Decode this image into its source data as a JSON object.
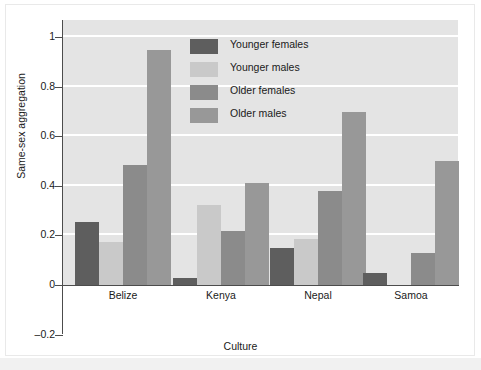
{
  "chart_data": {
    "type": "bar",
    "title": "",
    "xlabel": "Culture",
    "ylabel": "Same-sex aggregation",
    "categories": [
      "Belize",
      "Kenya",
      "Nepal",
      "Samoa"
    ],
    "series": [
      {
        "name": "Younger females",
        "color": "#5e5e5e",
        "values": [
          0.255,
          0.03,
          0.15,
          0.05
        ]
      },
      {
        "name": "Younger males",
        "color": "#c9c9c9",
        "values": [
          0.175,
          0.325,
          0.185,
          0.0
        ]
      },
      {
        "name": "Older females",
        "color": "#8b8b8b",
        "values": [
          0.485,
          0.22,
          0.38,
          0.13
        ]
      },
      {
        "name": "Older males",
        "color": "#989898",
        "values": [
          0.95,
          0.41,
          0.7,
          0.5
        ]
      }
    ],
    "ylim": [
      -0.2,
      1.07
    ],
    "yticks": [
      -0.2,
      0,
      0.2,
      0.4,
      0.6,
      0.8,
      1
    ],
    "ytick_labels": [
      "–0.2",
      "0",
      "0.2",
      "0.4",
      "0.6",
      "0.8",
      "1"
    ],
    "gridlines": [
      0.2,
      0.4,
      0.6,
      0.8,
      1
    ],
    "grid": true,
    "grid_color": "#ffffff",
    "plot_background": "#e4e4e4",
    "legend_position": "top-center"
  }
}
